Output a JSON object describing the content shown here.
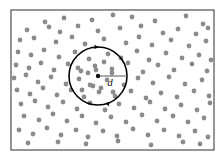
{
  "figure": {
    "background_color": "#ffffff",
    "width": 224,
    "height": 161
  },
  "frame": {
    "name": "plot-border",
    "x": 11,
    "y": 10,
    "width": 203,
    "height": 140,
    "stroke_color": "#3f3f3f",
    "stroke_width": 1.1
  },
  "labels": {
    "diameter_label": "d"
  },
  "chart_data": {
    "type": "scatter",
    "xlabel": "",
    "ylabel": "",
    "xlim": [
      11,
      214
    ],
    "ylim": [
      10,
      150
    ],
    "grid": false,
    "legend": "none",
    "marker_color": "#8b8b8b",
    "marker_radius": 2.4,
    "annotations": [
      {
        "type": "circle",
        "name": "sampling-circle",
        "cx": 98,
        "cy": 76,
        "r": 29,
        "stroke_color": "#000000",
        "label": "d"
      },
      {
        "type": "radius-line",
        "name": "diameter-indicator",
        "x1": 98,
        "y1": 76,
        "x2": 127,
        "y2": 76,
        "label": "d",
        "label_x": 110,
        "label_y": 86
      },
      {
        "type": "arrowhead",
        "name": "circle-arrow-top",
        "x": 99,
        "y": 47.5,
        "angle": 8
      },
      {
        "type": "arrowhead",
        "name": "circle-arrow-bottom",
        "x": 105,
        "y": 103,
        "angle": 195
      }
    ],
    "points": [
      [
        45,
        22
      ],
      [
        64,
        18
      ],
      [
        92,
        20
      ],
      [
        113,
        15
      ],
      [
        132,
        17
      ],
      [
        155,
        21
      ],
      [
        186,
        16
      ],
      [
        203,
        24
      ],
      [
        27,
        30
      ],
      [
        49,
        27
      ],
      [
        60,
        32
      ],
      [
        78,
        26
      ],
      [
        98,
        31
      ],
      [
        120,
        28
      ],
      [
        141,
        26
      ],
      [
        163,
        33
      ],
      [
        178,
        29
      ],
      [
        196,
        34
      ],
      [
        208,
        28
      ],
      [
        20,
        40
      ],
      [
        34,
        38
      ],
      [
        56,
        42
      ],
      [
        72,
        37
      ],
      [
        85,
        44
      ],
      [
        104,
        39
      ],
      [
        126,
        43
      ],
      [
        139,
        37
      ],
      [
        152,
        45
      ],
      [
        171,
        40
      ],
      [
        189,
        46
      ],
      [
        206,
        41
      ],
      [
        18,
        52
      ],
      [
        31,
        55
      ],
      [
        44,
        50
      ],
      [
        59,
        57
      ],
      [
        75,
        52
      ],
      [
        89,
        59
      ],
      [
        108,
        54
      ],
      [
        121,
        58
      ],
      [
        137,
        51
      ],
      [
        149,
        60
      ],
      [
        166,
        53
      ],
      [
        182,
        58
      ],
      [
        199,
        55
      ],
      [
        211,
        60
      ],
      [
        16,
        65
      ],
      [
        29,
        68
      ],
      [
        41,
        63
      ],
      [
        54,
        70
      ],
      [
        68,
        64
      ],
      [
        81,
        71
      ],
      [
        95,
        66
      ],
      [
        112,
        69
      ],
      [
        128,
        63
      ],
      [
        143,
        72
      ],
      [
        158,
        65
      ],
      [
        174,
        70
      ],
      [
        192,
        64
      ],
      [
        207,
        71
      ],
      [
        14,
        78
      ],
      [
        26,
        75
      ],
      [
        38,
        82
      ],
      [
        51,
        77
      ],
      [
        66,
        84
      ],
      [
        79,
        79
      ],
      [
        93,
        86
      ],
      [
        107,
        80
      ],
      [
        124,
        85
      ],
      [
        138,
        78
      ],
      [
        153,
        83
      ],
      [
        169,
        77
      ],
      [
        185,
        84
      ],
      [
        202,
        80
      ],
      [
        17,
        90
      ],
      [
        30,
        94
      ],
      [
        43,
        88
      ],
      [
        57,
        95
      ],
      [
        71,
        90
      ],
      [
        84,
        97
      ],
      [
        99,
        92
      ],
      [
        115,
        96
      ],
      [
        131,
        91
      ],
      [
        146,
        98
      ],
      [
        161,
        93
      ],
      [
        177,
        97
      ],
      [
        194,
        91
      ],
      [
        209,
        96
      ],
      [
        21,
        104
      ],
      [
        35,
        101
      ],
      [
        48,
        107
      ],
      [
        63,
        102
      ],
      [
        77,
        109
      ],
      [
        90,
        103
      ],
      [
        105,
        110
      ],
      [
        119,
        104
      ],
      [
        134,
        108
      ],
      [
        150,
        102
      ],
      [
        165,
        109
      ],
      [
        181,
        105
      ],
      [
        197,
        110
      ],
      [
        210,
        103
      ],
      [
        24,
        116
      ],
      [
        39,
        120
      ],
      [
        53,
        114
      ],
      [
        67,
        121
      ],
      [
        82,
        116
      ],
      [
        96,
        123
      ],
      [
        111,
        117
      ],
      [
        126,
        122
      ],
      [
        142,
        115
      ],
      [
        157,
        121
      ],
      [
        173,
        116
      ],
      [
        188,
        122
      ],
      [
        204,
        118
      ],
      [
        19,
        130
      ],
      [
        33,
        134
      ],
      [
        47,
        128
      ],
      [
        61,
        135
      ],
      [
        76,
        130
      ],
      [
        88,
        137
      ],
      [
        103,
        131
      ],
      [
        117,
        136
      ],
      [
        133,
        129
      ],
      [
        148,
        135
      ],
      [
        164,
        130
      ],
      [
        179,
        136
      ],
      [
        195,
        131
      ],
      [
        208,
        137
      ],
      [
        28,
        143
      ],
      [
        58,
        142
      ],
      [
        86,
        144
      ],
      [
        118,
        141
      ],
      [
        151,
        145
      ],
      [
        183,
        142
      ],
      [
        200,
        144
      ],
      [
        88,
        73
      ],
      [
        96,
        70
      ],
      [
        104,
        62
      ],
      [
        112,
        73
      ],
      [
        90,
        85
      ],
      [
        101,
        88
      ],
      [
        113,
        92
      ],
      [
        78,
        68
      ],
      [
        82,
        90
      ]
    ]
  }
}
